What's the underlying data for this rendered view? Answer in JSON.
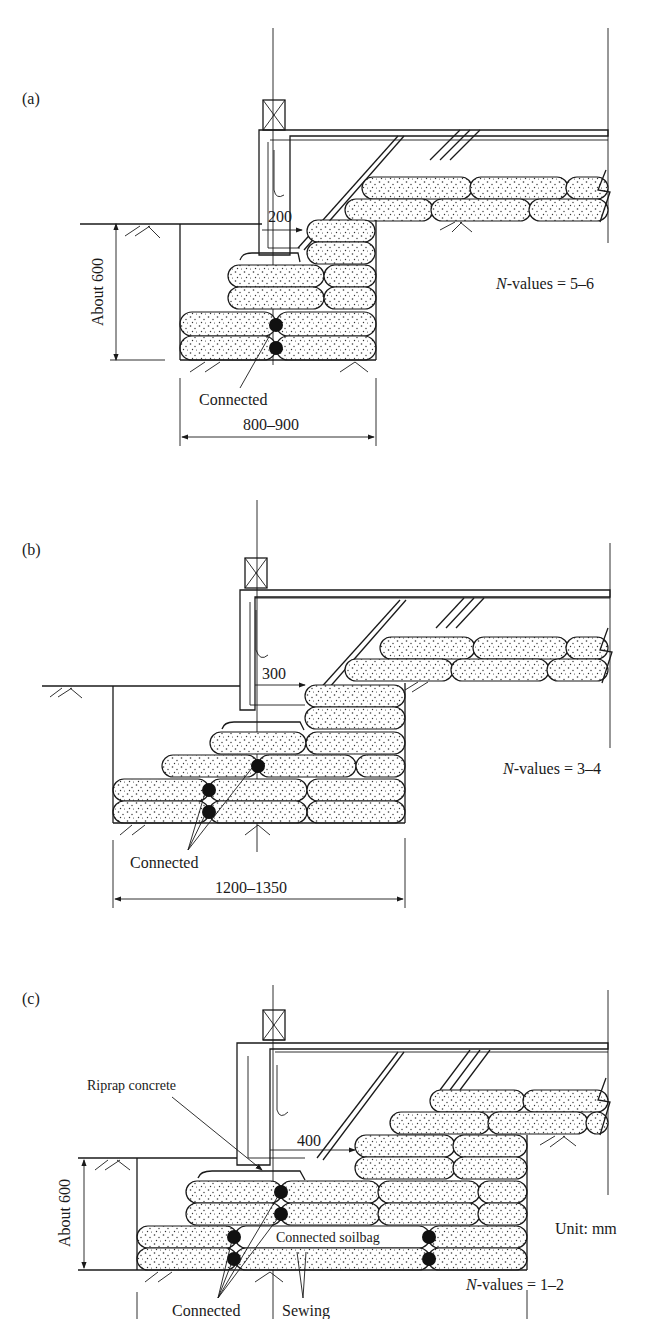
{
  "figure": {
    "unit_label": "Unit: mm",
    "panels": [
      {
        "id": "a",
        "label": "(a)",
        "depth_label": "About 600",
        "offset_label": "200",
        "width_label": "800–900",
        "connected_label": "Connected",
        "n_values_prefix": "N",
        "n_values_text": "-values = 5–6"
      },
      {
        "id": "b",
        "label": "(b)",
        "offset_label": "300",
        "width_label": "1200–1350",
        "connected_label": "Connected",
        "n_values_prefix": "N",
        "n_values_text": "-values = 3–4"
      },
      {
        "id": "c",
        "label": "(c)",
        "depth_label": "About 600",
        "offset_label": "400",
        "riprap_label": "Riprap concrete",
        "connected_soilbag_label": "Connected soilbag",
        "connected_label": "Connected",
        "sewing_label": "Sewing",
        "n_values_prefix": "N",
        "n_values_text": "-values = 1–2"
      }
    ]
  }
}
